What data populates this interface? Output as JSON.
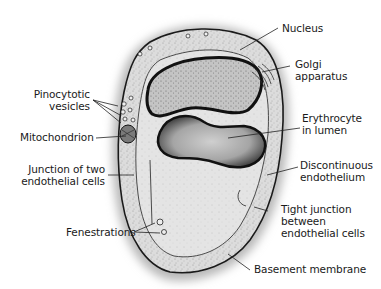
{
  "diagram": {
    "colors": {
      "background": "#ffffff",
      "cell_fill": "#d9d9d9",
      "lumen_fill": "#e6e6e6",
      "nucleus_fill": "#c8c8c8",
      "erythrocyte_fill": "#9a9a9a",
      "outline": "#1a1a1a",
      "shadow": "#9e9e9e",
      "leader_line": "#222222"
    },
    "labels": {
      "nucleus": {
        "line1": "Nucleus",
        "line2": ""
      },
      "golgi": {
        "line1": "Golgi",
        "line2": "apparatus"
      },
      "pinocytotic": {
        "line1": "Pinocytotic",
        "line2": "vesicles"
      },
      "mitochondrion": {
        "line1": "Mitochondrion",
        "line2": ""
      },
      "erythrocyte": {
        "line1": "Erythrocyte",
        "line2": "in lumen"
      },
      "junction": {
        "line1": "Junction of two",
        "line2": "endothelial cells"
      },
      "discontinuous": {
        "line1": "Discontinuous",
        "line2": "endothelium"
      },
      "fenestrations": {
        "line1": "Fenestrations",
        "line2": ""
      },
      "tight_junction": {
        "line1": "Tight junction",
        "line2": "between",
        "line3": "endothelial cells"
      },
      "basement": {
        "line1": "Basement membrane",
        "line2": ""
      }
    }
  }
}
